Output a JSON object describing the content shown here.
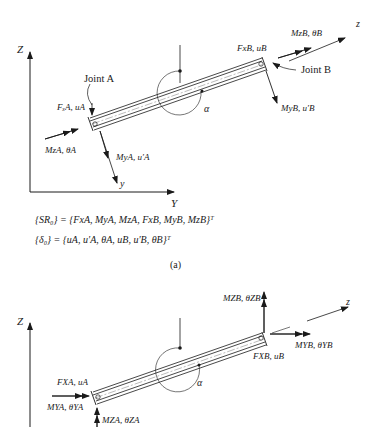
{
  "figure_a": {
    "axes": {
      "Z": "Z",
      "Y": "Y",
      "z_local": "z",
      "y_local": "y"
    },
    "joints": {
      "A": "Joint A",
      "B": "Joint B"
    },
    "angle": "α",
    "forces": {
      "FxA": "FₓA, uA",
      "MzA": "MzA, θA",
      "MyA": "MyA, u′A",
      "FxB": "FxB, uB",
      "MzB": "MzB, θB",
      "MyB": "MyB, u′B"
    },
    "equations": {
      "SR0": "{SR₀} = {FxA, MyA, MzA, FxB, MyB, MzB}ᵀ",
      "delta0": "{δ₀} = {uA, u′A, θA, uB, u′B, θB}ᵀ"
    },
    "caption": "(a)"
  },
  "figure_b": {
    "axes": {
      "Z": "Z",
      "z_local": "z"
    },
    "angle": "α",
    "forces": {
      "FXA": "FXA, uA",
      "MYA": "MYA, θYA",
      "MZA": "MZA, θZA",
      "MZB": "MZB, θZB",
      "MYB": "MYB, θYB",
      "FXB": "FXB, uB"
    }
  }
}
